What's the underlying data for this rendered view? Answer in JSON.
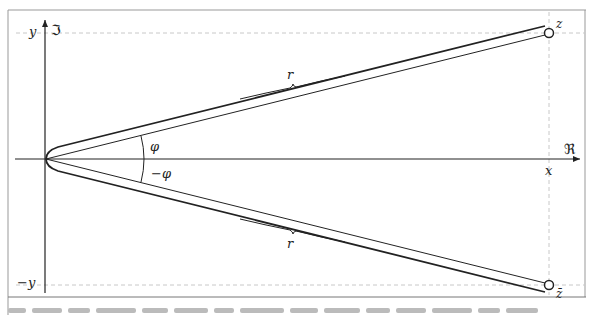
{
  "diagram": {
    "axes": {
      "x_label": "x",
      "y_label": "y",
      "neg_y_label": "−y",
      "real_axis_label": "ℜ",
      "imag_axis_label": "ℑ"
    },
    "points": {
      "z_label": "z",
      "z_conj_label": "z̄"
    },
    "angles": {
      "upper_label": "φ",
      "lower_label": "−φ"
    },
    "lengths": {
      "upper_radius_label": "r",
      "lower_radius_label": "r"
    },
    "colors": {
      "stroke": "#222222",
      "dashed_guide": "#c8c8c8",
      "frame": "#999999",
      "background": "#ffffff"
    }
  }
}
